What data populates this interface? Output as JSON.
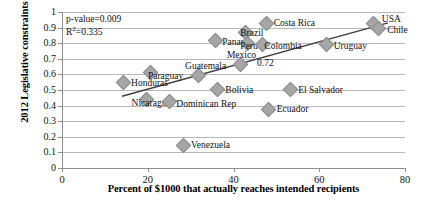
{
  "chart_data": {
    "type": "scatter",
    "title": "",
    "xlabel": "Percent of $1000 that actually reaches intended recipients",
    "ylabel": "2012 Legislative constraints score",
    "xlim": [
      0,
      80
    ],
    "ylim": [
      0,
      1
    ],
    "xticks": [
      "0",
      "20",
      "40",
      "60",
      "80"
    ],
    "yticks": [
      "0",
      "0.1",
      "0.2",
      "0.3",
      "0.4",
      "0.5",
      "0.6",
      "0.7",
      "0.8",
      "0.9",
      "1"
    ],
    "grid": true,
    "legend": "none",
    "marker_color": "#a6a6a6",
    "trendline_color": "#3f3f3f",
    "annotations": {
      "p_value": "p-value=0.009",
      "r_squared_prefix": "R",
      "r_squared_sup": "2",
      "r_squared_value": "=0.335",
      "point_value_label": "0.72"
    },
    "trendline": {
      "x0": 14,
      "y0": 0.46,
      "x1": 76,
      "y1": 0.93
    },
    "points": [
      {
        "name": "Honduras",
        "x": 14.0,
        "y": 0.557,
        "label_dx": 9,
        "label_dy": 3
      },
      {
        "name": "Paraguay",
        "x": 20.5,
        "y": 0.618,
        "label_dx": -2,
        "label_dy": 5
      },
      {
        "name": "Nicaragua",
        "x": 19.5,
        "y": 0.443,
        "label_dx": -14,
        "label_dy": 5
      },
      {
        "name": "Dominican Rep",
        "x": 24.8,
        "y": 0.43,
        "label_dx": 8,
        "label_dy": 4
      },
      {
        "name": "Venezuela",
        "x": 28.0,
        "y": 0.15,
        "label_dx": 9,
        "label_dy": 1
      },
      {
        "name": "Guatemala",
        "x": 31.5,
        "y": 0.598,
        "label_dx": -12,
        "label_dy": -8
      },
      {
        "name": "Panama",
        "x": 35.5,
        "y": 0.822,
        "label_dx": 8,
        "label_dy": 3
      },
      {
        "name": "Bolivia",
        "x": 36.0,
        "y": 0.508,
        "label_dx": 9,
        "label_dy": 2
      },
      {
        "name": "Mexico",
        "x": 41.5,
        "y": 0.672,
        "label_dx": -13,
        "label_dy": -7
      },
      {
        "name": "Brazil",
        "x": 42.5,
        "y": 0.878,
        "label_dx": -4,
        "label_dy": 3
      },
      {
        "name": "Peru",
        "x": 43.0,
        "y": 0.805,
        "label_dx": -6,
        "label_dy": 5
      },
      {
        "name": "Colombia",
        "x": 46.5,
        "y": 0.8,
        "label_dx": 3,
        "label_dy": 4
      },
      {
        "name": "Costa Rica",
        "x": 47.5,
        "y": 0.93,
        "label_dx": 8,
        "label_dy": 1
      },
      {
        "name": "Ecuador",
        "x": 48.0,
        "y": 0.38,
        "label_dx": 9,
        "label_dy": 1
      },
      {
        "name": "El Salvador",
        "x": 53.0,
        "y": 0.508,
        "label_dx": 9,
        "label_dy": 2
      },
      {
        "name": "Uruguay",
        "x": 61.5,
        "y": 0.8,
        "label_dx": 8,
        "label_dy": 4
      },
      {
        "name": "USA",
        "x": 72.5,
        "y": 0.93,
        "label_dx": 9,
        "label_dy": -3
      },
      {
        "name": "Chile",
        "x": 73.5,
        "y": 0.902,
        "label_dx": 10,
        "label_dy": 4
      }
    ]
  }
}
